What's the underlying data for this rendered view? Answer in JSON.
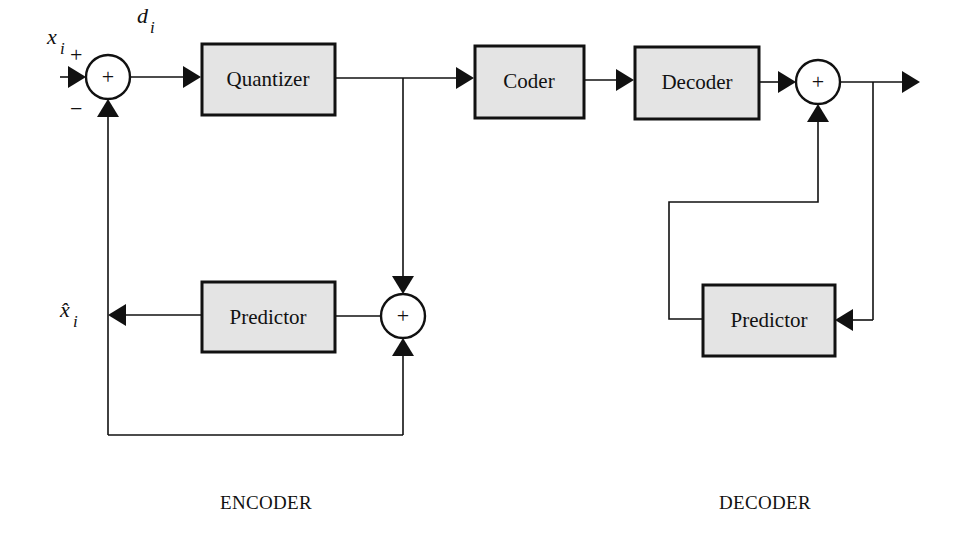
{
  "diagram": {
    "title": "",
    "colors": {
      "block_fill": "#e4e4e4",
      "stroke": "#111111",
      "background": "#ffffff"
    },
    "encoder": {
      "section_label": "ENCODER",
      "input_signal": {
        "symbol": "x",
        "subscript": "i"
      },
      "difference_signal": {
        "symbol": "d",
        "subscript": "i"
      },
      "prediction_signal": {
        "symbol": "x̂",
        "subscript": "i"
      },
      "input_sum": {
        "symbol": "+",
        "plus_sign": "+",
        "minus_sign": "−"
      },
      "quantizer_label": "Quantizer",
      "predictor_label": "Predictor",
      "feedback_sum": {
        "symbol": "+"
      }
    },
    "channel": {
      "coder_label": "Coder",
      "decoder_label": "Decoder"
    },
    "decoder": {
      "section_label": "DECODER",
      "output_sum": {
        "symbol": "+"
      },
      "predictor_label": "Predictor"
    },
    "nodes": [
      {
        "id": "sum1",
        "type": "summer",
        "label": "+"
      },
      {
        "id": "quantizer",
        "type": "block",
        "label": "Quantizer"
      },
      {
        "id": "coder",
        "type": "block",
        "label": "Coder"
      },
      {
        "id": "decoder",
        "type": "block",
        "label": "Decoder"
      },
      {
        "id": "sum3",
        "type": "summer",
        "label": "+"
      },
      {
        "id": "enc_predictor",
        "type": "block",
        "label": "Predictor"
      },
      {
        "id": "sum2",
        "type": "summer",
        "label": "+"
      },
      {
        "id": "dec_predictor",
        "type": "block",
        "label": "Predictor"
      }
    ],
    "edges": [
      {
        "from": "input",
        "to": "sum1",
        "label": "x_i",
        "sign": "+"
      },
      {
        "from": "sum1",
        "to": "quantizer",
        "label": "d_i"
      },
      {
        "from": "quantizer",
        "to": "coder"
      },
      {
        "from": "quantizer",
        "to": "sum2"
      },
      {
        "from": "sum2",
        "to": "enc_predictor"
      },
      {
        "from": "enc_predictor",
        "to": "sum1",
        "label": "x̂_i",
        "sign": "−"
      },
      {
        "from": "enc_predictor_output",
        "to": "sum2"
      },
      {
        "from": "coder",
        "to": "decoder"
      },
      {
        "from": "decoder",
        "to": "sum3"
      },
      {
        "from": "sum3",
        "to": "output"
      },
      {
        "from": "sum3",
        "to": "dec_predictor"
      },
      {
        "from": "dec_predictor",
        "to": "sum3"
      }
    ]
  }
}
